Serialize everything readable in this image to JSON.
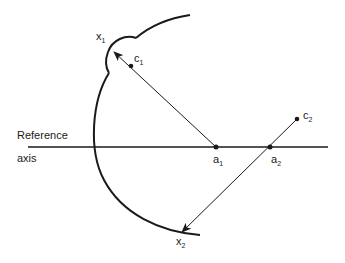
{
  "diagram": {
    "axis_label_line1": "Reference",
    "axis_label_line2": "axis",
    "points": {
      "x1": {
        "base": "x",
        "sub": "1"
      },
      "c1": {
        "base": "c",
        "sub": "1"
      },
      "a1": {
        "base": "a",
        "sub": "1"
      },
      "a2": {
        "base": "a",
        "sub": "2"
      },
      "c2": {
        "base": "c",
        "sub": "2"
      },
      "x2": {
        "base": "x",
        "sub": "2"
      }
    },
    "colors": {
      "stroke": "#1a1a1a",
      "background": "#ffffff"
    }
  }
}
